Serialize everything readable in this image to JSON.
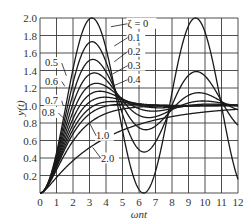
{
  "chart_data": {
    "type": "line",
    "title": "",
    "xlabel": "ωnt",
    "ylabel": "y(t)",
    "xlim": [
      0,
      12
    ],
    "ylim": [
      0,
      2.0
    ],
    "grid": true,
    "legend_position": "inline annotations",
    "x_ticks": [
      "0",
      "1",
      "2",
      "3",
      "4",
      "5",
      "6",
      "7",
      "8",
      "9",
      "10",
      "11",
      "12"
    ],
    "y_ticks": [
      "0.2",
      "0.4",
      "0.6",
      "0.8",
      "1.0",
      "1.2",
      "1.4",
      "1.6",
      "1.8",
      "2.0"
    ],
    "series": [
      {
        "name": "ζ = 0",
        "zeta": 0.0,
        "peak": 2.0,
        "peak_x": 3.14
      },
      {
        "name": "0.1",
        "zeta": 0.1,
        "peak": 1.73,
        "peak_x": 3.16
      },
      {
        "name": "0.2",
        "zeta": 0.2,
        "peak": 1.53,
        "peak_x": 3.21
      },
      {
        "name": "0.3",
        "zeta": 0.3,
        "peak": 1.37,
        "peak_x": 3.29
      },
      {
        "name": "0.4",
        "zeta": 0.4,
        "peak": 1.25,
        "peak_x": 3.43
      },
      {
        "name": "0.5",
        "zeta": 0.5,
        "peak": 1.16,
        "peak_x": 3.63
      },
      {
        "name": "0.6",
        "zeta": 0.6,
        "peak": 1.09,
        "peak_x": 3.93
      },
      {
        "name": "0.7",
        "zeta": 0.7,
        "peak": 1.05,
        "peak_x": 4.4
      },
      {
        "name": "0.8",
        "zeta": 0.8,
        "peak": 1.02,
        "peak_x": 5.24
      },
      {
        "name": "1.0",
        "zeta": 1.0,
        "peak": 1.0,
        "peak_x": null
      },
      {
        "name": "2.0",
        "zeta": 2.0,
        "peak": 1.0,
        "peak_x": null
      }
    ],
    "annotations": [
      {
        "text": "ζ = 0",
        "x": 5.3,
        "y": 1.9,
        "leader_to": [
          4.3,
          1.9
        ]
      },
      {
        "text": "0.1",
        "x": 5.3,
        "y": 1.74,
        "leader_to": [
          4.5,
          1.68
        ]
      },
      {
        "text": "0.2",
        "x": 5.3,
        "y": 1.58,
        "leader_to": [
          4.5,
          1.5
        ]
      },
      {
        "text": "0.3",
        "x": 5.3,
        "y": 1.42,
        "leader_to": [
          4.4,
          1.36
        ]
      },
      {
        "text": "0.4",
        "x": 5.3,
        "y": 1.26,
        "leader_to": [
          4.4,
          1.22
        ]
      },
      {
        "text": "0.5",
        "x": 0.3,
        "y": 1.45,
        "leader_to": [
          1.6,
          1.34
        ]
      },
      {
        "text": "0.6",
        "x": 0.3,
        "y": 1.24,
        "leader_to": [
          1.5,
          1.22
        ]
      },
      {
        "text": "0.7",
        "x": 0.3,
        "y": 1.02,
        "leader_to": [
          1.4,
          1.0
        ]
      },
      {
        "text": "0.8",
        "x": 0.1,
        "y": 0.88,
        "leader_to": [
          1.4,
          0.86
        ]
      },
      {
        "text": "1.0",
        "x": 3.4,
        "y": 0.62,
        "leader_to": [
          3.0,
          0.8
        ]
      },
      {
        "text": "2.0",
        "x": 3.7,
        "y": 0.36,
        "leader_to": [
          3.2,
          0.52
        ]
      }
    ]
  },
  "colors": {
    "line": "#1a1a1a",
    "grid": "#3a3a3a",
    "background": "#ffffff"
  },
  "plot_box": {
    "left": 40,
    "top": 18,
    "right": 238,
    "bottom": 193
  }
}
